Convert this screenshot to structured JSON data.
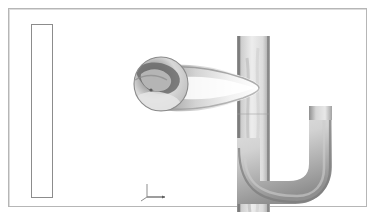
{
  "legend": {
    "name": "contour-colour-legend",
    "labels": [
      "6.12e+00",
      "5.82e+00",
      "5.51e+00",
      "5.20e+00",
      "4.90e+00",
      "4.59e+00",
      "4.29e+00",
      "3.98e+00",
      "3.67e+00",
      "3.37e+00",
      "3.06e+00",
      "2.75e+00",
      "2.45e+00",
      "2.14e+00",
      "1.84e+00",
      "1.53e+00",
      "1.22e+00",
      "9.18e-01",
      "6.12e-01",
      "3.06e-01",
      "0.00e+00"
    ],
    "band_colors": [
      "#3b3b3b",
      "#4a4a4a",
      "#606060",
      "#787878",
      "#8f8f8f",
      "#a8a8a8",
      "#c6c6c6",
      "#e2e2e2",
      "#f4f4f4",
      "#fbfbfb",
      "#ffffff",
      "#f2f2f2",
      "#e3e3e3",
      "#d4d4d4",
      "#c2c2c2",
      "#b0b0b0",
      "#9a9a9a",
      "#7f7f7f",
      "#606060",
      "#3d3d3d",
      "#121212"
    ],
    "max": "6.12e+00",
    "min": "0.00e+00"
  },
  "axes_triad": {
    "z_label": "z",
    "y_label": "y",
    "x_label": "x"
  },
  "chart_data": {
    "type": "heatmap",
    "title": "",
    "subtitle": "",
    "xlabel": "",
    "ylabel": "",
    "legend_position": "left",
    "grid": false,
    "colormap": "grayscale",
    "levels": 21,
    "value_range": [
      0.0,
      6.12
    ],
    "tick_values": [
      6.12,
      5.82,
      5.51,
      5.2,
      4.9,
      4.59,
      4.29,
      3.98,
      3.67,
      3.37,
      3.06,
      2.75,
      2.45,
      2.14,
      1.84,
      1.53,
      1.22,
      0.918,
      0.612,
      0.306,
      0.0
    ],
    "tick_labels": [
      "6.12e+00",
      "5.82e+00",
      "5.51e+00",
      "5.20e+00",
      "4.90e+00",
      "4.59e+00",
      "4.29e+00",
      "3.98e+00",
      "3.67e+00",
      "3.37e+00",
      "3.06e+00",
      "2.75e+00",
      "2.45e+00",
      "2.14e+00",
      "1.84e+00",
      "1.53e+00",
      "1.22e+00",
      "9.18e-01",
      "6.12e-01",
      "3.06e-01",
      "0.00e+00"
    ],
    "annotations": [
      "z",
      "y",
      "x"
    ],
    "regions": [
      {
        "name": "circular-bulb",
        "approx_value": 2.5
      },
      {
        "name": "tapered-neck",
        "approx_value": 4.1
      },
      {
        "name": "vertical-duct",
        "approx_value": 3.6
      },
      {
        "name": "lower-u-bend",
        "approx_value": 3.0
      },
      {
        "name": "outlet-riser",
        "approx_value": 3.4
      }
    ]
  }
}
